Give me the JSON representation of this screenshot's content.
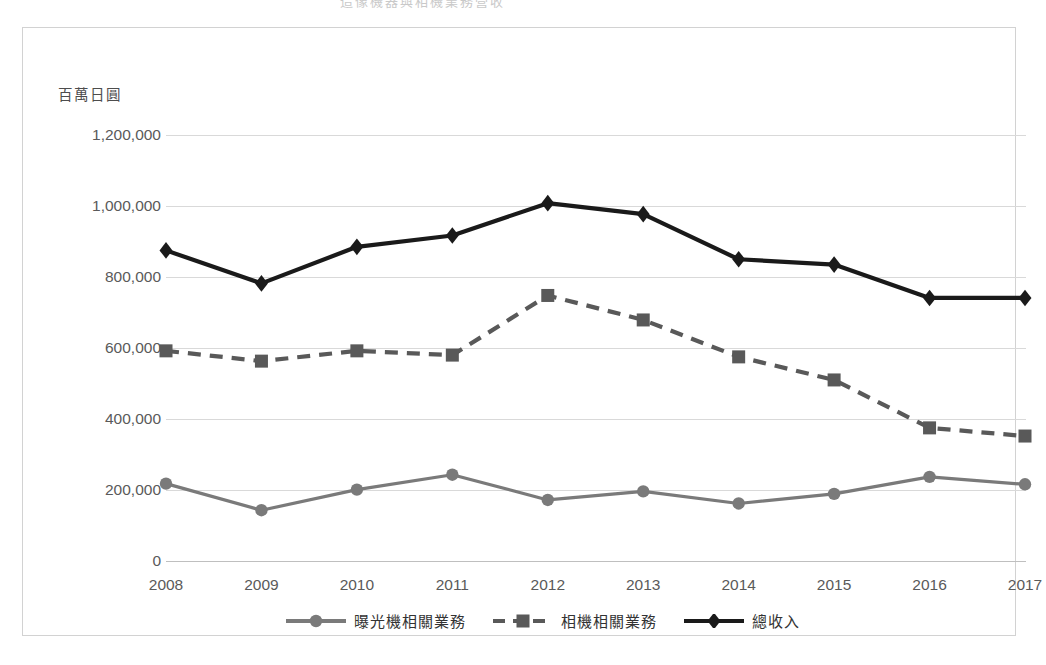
{
  "top_partial_text": "造像機器與相機業務營收",
  "axis_unit_label": "百萬日圓",
  "colors": {
    "total_series": "#1a1a1a",
    "camera_series": "#595959",
    "litho_series": "#7a7a7a",
    "gridline": "#d9d9d9",
    "frame_border": "#d2d2d2",
    "tick_text": "#5a5a5a"
  },
  "legend": {
    "position": "bottom",
    "items": [
      {
        "label": "曝光機相關業務",
        "marker": "circle",
        "dash": "solid",
        "color": "#7a7a7a"
      },
      {
        "label": "相機相關業務",
        "marker": "square",
        "dash": "dashed",
        "color": "#595959"
      },
      {
        "label": "總收入",
        "marker": "diamond",
        "dash": "solid",
        "color": "#1a1a1a"
      }
    ]
  },
  "chart_data": {
    "type": "line",
    "title": "",
    "subtitle": "",
    "xlabel": "",
    "ylabel": "百萬日圓",
    "grid": true,
    "ylim": [
      0,
      1200000
    ],
    "ytick_step": 200000,
    "ytick_labels": [
      "0",
      "200,000",
      "400,000",
      "600,000",
      "800,000",
      "1,000,000",
      "1,200,000"
    ],
    "ytick_values": [
      0,
      200000,
      400000,
      600000,
      800000,
      1000000,
      1200000
    ],
    "categories": [
      "2008",
      "2009",
      "2010",
      "2011",
      "2012",
      "2013",
      "2014",
      "2015",
      "2016",
      "2017"
    ],
    "x": [
      2008,
      2009,
      2010,
      2011,
      2012,
      2013,
      2014,
      2015,
      2016,
      2017
    ],
    "series": [
      {
        "name": "曝光機相關業務",
        "marker": "circle",
        "dash": "solid",
        "color": "#7a7a7a",
        "values": [
          218000,
          143000,
          201000,
          243000,
          172000,
          196000,
          162000,
          189000,
          237000,
          216000
        ]
      },
      {
        "name": "相機相關業務",
        "marker": "square",
        "dash": "dashed",
        "color": "#595959",
        "values": [
          592000,
          563000,
          592000,
          580000,
          748000,
          679000,
          575000,
          510000,
          375000,
          352000
        ]
      },
      {
        "name": "總收入",
        "marker": "diamond",
        "dash": "solid",
        "color": "#1a1a1a",
        "values": [
          875000,
          782000,
          885000,
          917000,
          1008000,
          977000,
          850000,
          835000,
          741000,
          741000
        ]
      }
    ]
  }
}
